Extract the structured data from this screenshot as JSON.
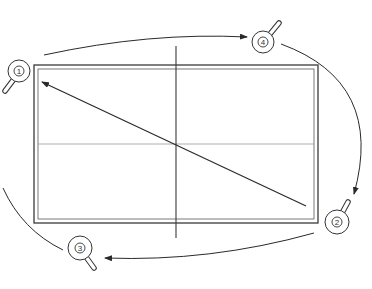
{
  "diagram": {
    "type": "table-tennis-doubles-rotation",
    "colors": {
      "line": "#2a2a2a",
      "table_edge": "#3a3a3a",
      "center_line": "#8a8a8a",
      "background": "#ffffff"
    },
    "table": {
      "outer": {
        "x": 34,
        "y": 65,
        "w": 284,
        "h": 158
      },
      "inner": {
        "x": 38,
        "y": 69,
        "w": 276,
        "h": 150
      },
      "net_line": {
        "x": 176,
        "y1": 46,
        "y2": 238
      },
      "center_line": {
        "y": 144,
        "x1": 38,
        "x2": 314
      }
    },
    "serve_arrow": {
      "from": [
        306,
        206
      ],
      "to": [
        40,
        81
      ]
    },
    "players": [
      {
        "label": "1",
        "cx": 19,
        "cy": 71,
        "handle_angle": 120
      },
      {
        "label": "2",
        "cx": 337,
        "cy": 222,
        "handle_angle": -60
      },
      {
        "label": "3",
        "cx": 80,
        "cy": 248,
        "handle_angle": 60
      },
      {
        "label": "4",
        "cx": 263,
        "cy": 42,
        "handle_angle": -45
      }
    ],
    "rotation_arrows": [
      {
        "name": "1-to-4",
        "path": "M 44 55 Q 150 32 247 37",
        "head_at": [
          247,
          37
        ]
      },
      {
        "name": "4-to-2",
        "path": "M 281 44 Q 380 80 354 193",
        "head_at": [
          354,
          193
        ]
      },
      {
        "name": "2-to-3",
        "path": "M 314 233 Q 210 260 105 258",
        "head_at": [
          105,
          258
        ]
      },
      {
        "name": "3-to-1",
        "path": "M 62 249 Q 20 230 3 187",
        "head_at": null
      }
    ]
  }
}
